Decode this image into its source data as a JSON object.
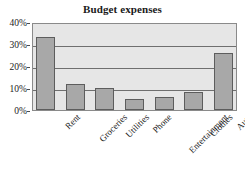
{
  "chart_data": {
    "type": "bar",
    "title": "Budget expenses",
    "xlabel": "",
    "ylabel": "",
    "categories": [
      "Rent",
      "Groceries",
      "Utilities",
      "Phone",
      "Entertainment",
      "Clothes",
      "Auto"
    ],
    "values": [
      33,
      12,
      10,
      5,
      6,
      8,
      26
    ],
    "value_unit": "%",
    "ylim": [
      0,
      40
    ],
    "ytick_values": [
      0,
      10,
      20,
      30,
      40
    ],
    "ytick_labels": [
      "0%",
      "10%",
      "20%",
      "30%",
      "40%"
    ],
    "grid": true,
    "grid_axis": "y",
    "legend": false,
    "legend_position": "none",
    "series": [
      {
        "name": "Budget expenses",
        "values": [
          33,
          12,
          10,
          5,
          6,
          8,
          26
        ]
      }
    ],
    "colors": {
      "bar_fill": "#a8a8a8",
      "bar_edge": "#5d5d5d",
      "plot_background": "#e6e6e6",
      "grid_color": "#6f6f6f",
      "frame_color": "#8a8a8a",
      "text_color": "#1a1a1a",
      "page_background": "#ffffff"
    }
  }
}
